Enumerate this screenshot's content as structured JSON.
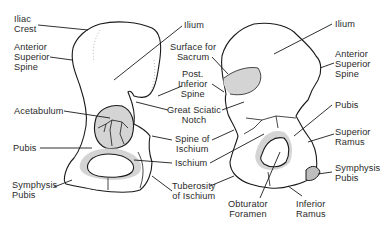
{
  "figure": {
    "left_view": {
      "labels": [
        {
          "id": "iliac-crest",
          "text": "Iliac\nCrest"
        },
        {
          "id": "anterior-superior-spine",
          "text": "Anterior\nSuperior\nSpine"
        },
        {
          "id": "acetabulum",
          "text": "Acetabulum"
        },
        {
          "id": "pubis",
          "text": "Pubis"
        },
        {
          "id": "symphysis-pubis",
          "text": "Symphysis\nPubis"
        },
        {
          "id": "ilium",
          "text": "Ilium"
        }
      ]
    },
    "center_labels": [
      {
        "id": "surface-for-sacrum",
        "text": "Surface for\nSacrum"
      },
      {
        "id": "post-inferior-spine",
        "text": "Post.\nInferior\nSpine"
      },
      {
        "id": "great-sciatic-notch",
        "text": "Great Sciatic\nNotch"
      },
      {
        "id": "spine-of-ischium",
        "text": "Spine of\nIschium"
      },
      {
        "id": "ischium",
        "text": "Ischium"
      },
      {
        "id": "tuberosity-of-ischium",
        "text": "Tuberosity\nof Ischium"
      },
      {
        "id": "obturator-foramen",
        "text": "Obturator\nForamen"
      },
      {
        "id": "inferior-ramus",
        "text": "Inferior\nRamus"
      }
    ],
    "right_view": {
      "labels": [
        {
          "id": "ilium",
          "text": "Ilium"
        },
        {
          "id": "anterior-superior-spine",
          "text": "Anterior\nSuperior\nSpine"
        },
        {
          "id": "pubis",
          "text": "Pubis"
        },
        {
          "id": "superior-ramus",
          "text": "Superior\nRamus"
        },
        {
          "id": "symphysis-pubis",
          "text": "Symphysis\nPubis"
        }
      ]
    }
  }
}
